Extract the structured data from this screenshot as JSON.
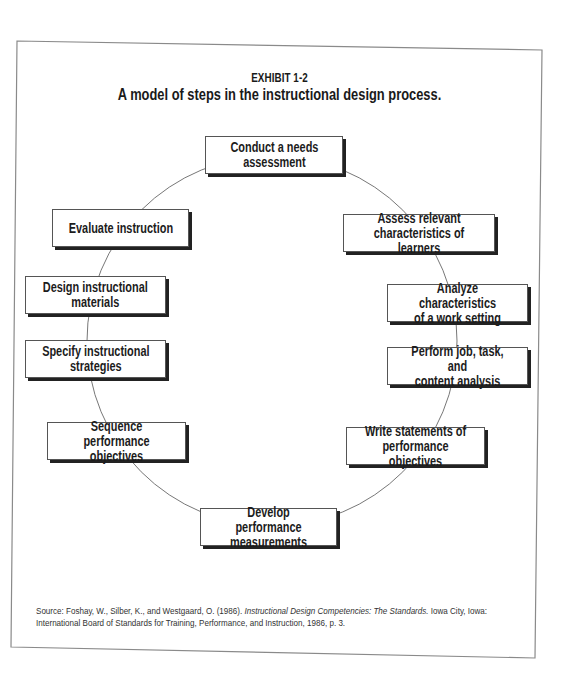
{
  "exhibit": {
    "label": "EXHIBIT 1-2",
    "title": "A model of steps in the instructional design process."
  },
  "diagram": {
    "type": "cycle",
    "connector": "circle",
    "steps": [
      {
        "label": "Conduct a needs\nassessment"
      },
      {
        "label": "Assess relevant\ncharacteristics of learners"
      },
      {
        "label": "Analyze characteristics\nof a work setting"
      },
      {
        "label": "Perform job, task, and\ncontent analysis"
      },
      {
        "label": "Write statements of\nperformance objectives"
      },
      {
        "label": "Develop performance\nmeasurements"
      },
      {
        "label": "Sequence performance\nobjectives"
      },
      {
        "label": "Specify instructional\nstrategies"
      },
      {
        "label": "Design instructional\nmaterials"
      },
      {
        "label": "Evaluate instruction"
      }
    ]
  },
  "source": {
    "prefix": "Source: Foshay, W., Silber, K., and Westgaard, O. (1986). ",
    "book_title": "Instructional Design Competencies: The Standards.",
    "suffix_line1": " Iowa City, Iowa:",
    "line2": "International Board of Standards for Training, Performance, and Instruction, 1986, p. 3."
  },
  "colors": {
    "frame": "#8a8a8a",
    "box_border": "#555555",
    "box_shadow": "#222222",
    "circle": "#777777",
    "text": "#1a1a1a"
  }
}
